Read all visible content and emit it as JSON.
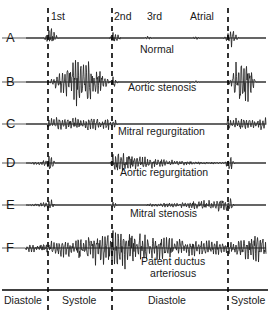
{
  "figure": {
    "colors": {
      "trace": "#222222",
      "divider": "#000000",
      "axis": "#000000",
      "background": "#ffffff"
    }
  },
  "timing_labels": [
    {
      "id": "s1",
      "text": "1st",
      "x": 51,
      "y": 16
    },
    {
      "id": "s2",
      "text": "2nd",
      "x": 114,
      "y": 16
    },
    {
      "id": "s3",
      "text": "3rd",
      "x": 147,
      "y": 16
    },
    {
      "id": "atrial",
      "text": "Atrial",
      "x": 190,
      "y": 16
    }
  ],
  "dividers": [
    {
      "id": "divider-s1",
      "x": 48
    },
    {
      "id": "divider-s2",
      "x": 112
    },
    {
      "id": "divider-s4",
      "x": 228
    }
  ],
  "phases": [
    {
      "id": "phase-diastole-1",
      "text": "Diastole",
      "x": 3,
      "width": 45,
      "y": 298
    },
    {
      "id": "phase-systole-1",
      "text": "Systole",
      "x": 50,
      "width": 62,
      "y": 298
    },
    {
      "id": "phase-diastole-2",
      "text": "Diastole",
      "x": 114,
      "width": 114,
      "y": 298
    },
    {
      "id": "phase-systole-2",
      "text": "Systole",
      "x": 230,
      "width": 40,
      "y": 298
    }
  ],
  "axis": {
    "y": 290,
    "x_start": 2,
    "x_end": 268
  },
  "rows": [
    {
      "letter": "A",
      "condition": "Normal",
      "letter_x": 6,
      "letter_y": 31,
      "baseline_y": 38,
      "label_x": 165,
      "label_y": 48,
      "label_align": "center"
    },
    {
      "letter": "B",
      "condition": "Aortic stenosis",
      "letter_x": 6,
      "letter_y": 75,
      "baseline_y": 82,
      "label_x": 170,
      "label_y": 86,
      "label_align": "center"
    },
    {
      "letter": "C",
      "condition": "Mitral regurgitation",
      "letter_x": 6,
      "letter_y": 117,
      "baseline_y": 124,
      "label_x": 170,
      "label_y": 130,
      "label_align": "center"
    },
    {
      "letter": "D",
      "condition": "Aortic regurgitation",
      "letter_x": 6,
      "letter_y": 156,
      "baseline_y": 163,
      "label_x": 170,
      "label_y": 171,
      "label_align": "center"
    },
    {
      "letter": "E",
      "condition": "Mitral stenosis",
      "letter_x": 6,
      "letter_y": 198,
      "baseline_y": 205,
      "label_x": 170,
      "label_y": 212,
      "label_align": "center"
    },
    {
      "letter": "F",
      "condition": "Patent ductus arteriosus",
      "condition_line_1": "Patent ductus",
      "condition_line_2": "arteriosus",
      "letter_x": 6,
      "letter_y": 241,
      "baseline_y": 248,
      "label_x": 170,
      "label_y": 258,
      "label_align": "center"
    }
  ],
  "chart_data": {
    "type": "line",
    "xlabel": "Cardiac cycle",
    "ylabel": "Sound amplitude",
    "x_axis_segments": [
      "Diastole",
      "Systole",
      "Diastole",
      "Systole"
    ],
    "event_markers": [
      "1st",
      "2nd",
      "3rd",
      "Atrial"
    ],
    "series": [
      {
        "name": "Normal",
        "row": "A",
        "description": "Sharp first and second heart sounds with low-amplitude third and atrial sounds; no murmur.",
        "features": [
          {
            "event": "1st",
            "amplitude": 10,
            "shape": "spike"
          },
          {
            "event": "2nd",
            "amplitude": 7,
            "shape": "spike"
          },
          {
            "event": "3rd",
            "amplitude": 1.5,
            "shape": "low-bump"
          },
          {
            "event": "Atrial",
            "amplitude": 1.5,
            "shape": "low-bump"
          }
        ]
      },
      {
        "name": "Aortic stenosis",
        "row": "B",
        "description": "Crescendo-decrescendo (diamond-shaped) systolic ejection murmur between first and second sounds.",
        "features": [
          {
            "event": "1st",
            "amplitude": 9,
            "shape": "spike"
          },
          {
            "event": "systolic-murmur",
            "amplitude": 22,
            "shape": "diamond"
          },
          {
            "event": "2nd",
            "amplitude": 6,
            "shape": "spike"
          }
        ]
      },
      {
        "name": "Mitral regurgitation",
        "row": "C",
        "description": "Uniform holosystolic plateau murmur filling systole from first to second sound.",
        "features": [
          {
            "event": "1st",
            "amplitude": 6,
            "shape": "spike"
          },
          {
            "event": "systolic-murmur",
            "amplitude": 6,
            "shape": "plateau"
          },
          {
            "event": "2nd",
            "amplitude": 6,
            "shape": "spike"
          }
        ]
      },
      {
        "name": "Aortic regurgitation",
        "row": "D",
        "description": "Decrescendo early diastolic murmur beginning at the second sound and fading through diastole.",
        "features": [
          {
            "event": "1st",
            "amplitude": 9,
            "shape": "spike"
          },
          {
            "event": "2nd",
            "amplitude": 7,
            "shape": "spike"
          },
          {
            "event": "diastolic-murmur",
            "amplitude": 12,
            "shape": "decrescendo"
          }
        ]
      },
      {
        "name": "Mitral stenosis",
        "row": "E",
        "description": "Quiet early diastole then mid-diastolic rumble with presystolic crescendo before the first sound.",
        "features": [
          {
            "event": "1st",
            "amplitude": 8,
            "shape": "spike"
          },
          {
            "event": "2nd",
            "amplitude": 6,
            "shape": "spike"
          },
          {
            "event": "diastolic-rumble",
            "amplitude": 5,
            "shape": "crescendo-late"
          }
        ]
      },
      {
        "name": "Patent ductus arteriosus",
        "row": "F",
        "description": "Continuous machinery murmur spanning systole and diastole, peaking around the second sound.",
        "features": [
          {
            "event": "continuous-murmur",
            "amplitude": 16,
            "shape": "continuous-peak-at-s2"
          }
        ]
      }
    ]
  }
}
